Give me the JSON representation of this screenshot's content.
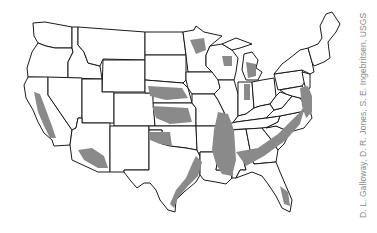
{
  "map": {
    "title": "Conterminous United States",
    "region_count": 48,
    "colors": {
      "background": "#ffffff",
      "state_border": "#1a1a1a",
      "shaded_area": "#8a8a8a",
      "credit_text": "#8a8a8a"
    },
    "legend": [],
    "shaded_regions": [
      "Central Valley, California",
      "Southern Arizona basins",
      "High Plains (Nebraska, Kansas, Oklahoma, Texas panhandle)",
      "Texas Gulf Coast",
      "Mississippi Embayment",
      "Louisiana Gulf Coast",
      "Alabama / Georgia coastal plain",
      "Atlantic coastal plain (Carolinas, Virginia, Maryland, Delaware, New Jersey)",
      "Florida peninsula",
      "Northern Wisconsin / Michigan",
      "Minnesota"
    ]
  },
  "credit": "D. L. Galloway, D. R. Jones, S. E. Ingebritsen, USGS"
}
